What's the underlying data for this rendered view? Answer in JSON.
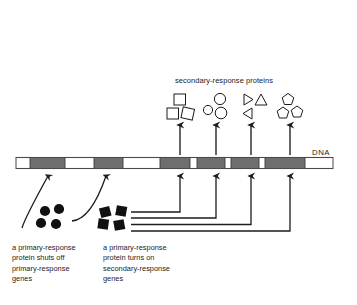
{
  "figure": {
    "background_color": "#ffffff",
    "ink_color": "#1c1c1c",
    "gene_fill_color": "#6e6e6e",
    "dna_outline_color": "#4a4a4a",
    "protein_fill_color": "#111111"
  },
  "headings": {
    "secondary_proteins": "secondary-response proteins",
    "dna_label": "DNA"
  },
  "captions": {
    "left": "a primary-response\nprotein shuts off\nprimary-response\ngenes",
    "right": "a primary-response\nprotein turns on\nsecondary-response\ngenes"
  },
  "dna": {
    "label": "DNA",
    "x_start": 16,
    "x_end": 333,
    "y_center": 163,
    "height": 11,
    "genes": [
      {
        "name": "primary-response-gene-1",
        "x": 30,
        "width": 35,
        "role": "primary"
      },
      {
        "name": "primary-response-gene-2",
        "x": 94,
        "width": 29,
        "role": "primary"
      },
      {
        "name": "secondary-response-gene-1",
        "x": 160,
        "width": 30,
        "role": "secondary"
      },
      {
        "name": "secondary-response-gene-2",
        "x": 197,
        "width": 28,
        "role": "secondary"
      },
      {
        "name": "secondary-response-gene-3",
        "x": 231,
        "width": 28,
        "role": "secondary"
      },
      {
        "name": "secondary-response-gene-4",
        "x": 265,
        "width": 40,
        "role": "secondary"
      }
    ]
  },
  "protein_groups": [
    {
      "name": "secondary-protein-group-squares",
      "shape": "square",
      "count": 3,
      "center_x": 180,
      "gene_index": 2
    },
    {
      "name": "secondary-protein-group-circles",
      "shape": "circle",
      "count": 3,
      "center_x": 216,
      "gene_index": 3
    },
    {
      "name": "secondary-protein-group-triangles",
      "shape": "triangle",
      "count": 3,
      "center_x": 251,
      "gene_index": 4
    },
    {
      "name": "secondary-protein-group-pentagons",
      "shape": "pentagon",
      "count": 3,
      "center_x": 290,
      "gene_index": 5
    }
  ],
  "primary_proteins": [
    {
      "name": "repressor-protein-cluster",
      "shape": "filled-circle",
      "count": 4,
      "action": "shuts off primary-response genes",
      "targets": [
        "primary-response-gene-1",
        "primary-response-gene-2"
      ]
    },
    {
      "name": "activator-protein-cluster",
      "shape": "filled-square",
      "count": 4,
      "action": "turns on secondary-response genes",
      "targets": [
        "secondary-response-gene-1",
        "secondary-response-gene-2",
        "secondary-response-gene-3",
        "secondary-response-gene-4"
      ]
    }
  ],
  "arrows": {
    "transcription_arrows": [
      {
        "name": "transcription-arrow-1",
        "x": 180,
        "from_y": 155,
        "to_y": 123
      },
      {
        "name": "transcription-arrow-2",
        "x": 216,
        "from_y": 155,
        "to_y": 123
      },
      {
        "name": "transcription-arrow-3",
        "x": 251,
        "from_y": 155,
        "to_y": 123
      },
      {
        "name": "transcription-arrow-4",
        "x": 290,
        "from_y": 155,
        "to_y": 123
      }
    ],
    "regulation_arrows": [
      {
        "name": "regulation-arrow-gene-1",
        "type": "curved",
        "target_x": 48
      },
      {
        "name": "regulation-arrow-gene-2",
        "type": "curved",
        "target_x": 106
      },
      {
        "name": "activation-arrow-gene-3",
        "type": "elbow",
        "target_x": 180,
        "rail_y": 212
      },
      {
        "name": "activation-arrow-gene-4",
        "type": "elbow",
        "target_x": 216,
        "rail_y": 218
      },
      {
        "name": "activation-arrow-gene-5",
        "type": "elbow",
        "target_x": 251,
        "rail_y": 224
      },
      {
        "name": "activation-arrow-gene-6",
        "type": "elbow",
        "target_x": 290,
        "rail_y": 231
      }
    ]
  }
}
